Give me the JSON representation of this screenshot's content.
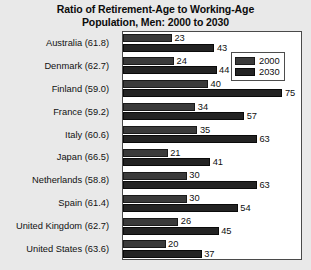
{
  "chart_data": {
    "type": "bar",
    "orientation": "horizontal",
    "title": "Ratio of Retirement-Age to Working-Age Population, Men: 2000 to 2030",
    "title_lines": [
      "Ratio of Retirement-Age to Working-Age",
      "Population, Men: 2000 to 2030"
    ],
    "categories": [
      "Australia (61.8)",
      "Denmark (62.7)",
      "Finland (59.0)",
      "France (59.2)",
      "Italy (60.6)",
      "Japan (66.5)",
      "Netherlands (58.8)",
      "Spain (61.4)",
      "United Kingdom (62.7)",
      "United States (63.6)"
    ],
    "series": [
      {
        "name": "2000",
        "color": "#3a3a3a",
        "values": [
          23,
          24,
          40,
          34,
          35,
          21,
          30,
          30,
          26,
          20
        ]
      },
      {
        "name": "2030",
        "color": "#232323",
        "values": [
          43,
          44,
          75,
          57,
          63,
          41,
          63,
          54,
          45,
          37
        ]
      }
    ],
    "xlabel": "",
    "ylabel": "",
    "xlim": [
      0,
      80
    ],
    "grid": false,
    "legend_position": "top-right",
    "value_labels": true
  },
  "legend": {
    "items": [
      {
        "label": "2000"
      },
      {
        "label": "2030"
      }
    ]
  }
}
